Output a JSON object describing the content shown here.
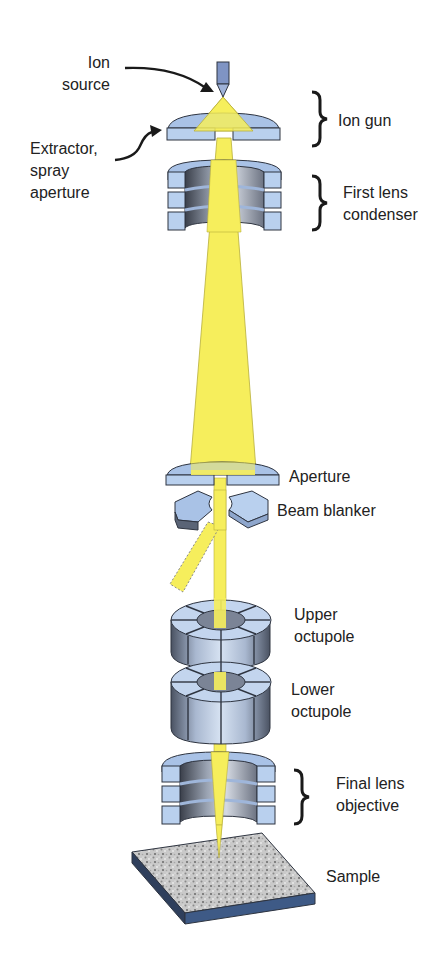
{
  "diagram": {
    "type": "FIB ion column schematic",
    "colors": {
      "beam": "#F6EE5C",
      "beam_edge": "#B8AE3A",
      "metal_light": "#B9D0EE",
      "metal_mid": "#94B2DA",
      "metal_dark": "#4E5A70",
      "outline": "#2E3440",
      "sample_side": "#3E5A86",
      "label": "#222222"
    },
    "labels": {
      "ion_source": [
        "Ion",
        "source"
      ],
      "extractor": [
        "Extractor,",
        "spray",
        "aperture"
      ],
      "ion_gun": "Ion gun",
      "first_lens": [
        "First lens",
        "condenser"
      ],
      "aperture": "Aperture",
      "beam_blanker": "Beam blanker",
      "upper_octupole": [
        "Upper",
        "octupole"
      ],
      "lower_octupole": [
        "Lower",
        "octupole"
      ],
      "final_lens": [
        "Final lens",
        "objective"
      ],
      "sample": "Sample"
    }
  }
}
